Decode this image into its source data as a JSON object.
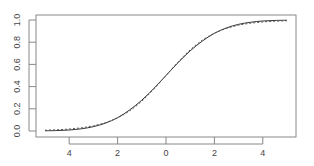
{
  "chart_data": {
    "type": "line",
    "title": "",
    "xlabel": "",
    "ylabel": "",
    "xlim": [
      -5.3,
      5.4
    ],
    "ylim": [
      -0.04,
      1.04
    ],
    "grid": false,
    "legend": null,
    "x_ticks": [
      -4,
      -2,
      0,
      2,
      4
    ],
    "x_tick_labels": [
      "4",
      "2",
      "0",
      "2",
      "4"
    ],
    "y_ticks": [
      0.0,
      0.2,
      0.4,
      0.6,
      0.8,
      1.0
    ],
    "y_tick_labels": [
      "0.0",
      "0.2",
      "0.4",
      "0.6",
      "0.8",
      "1.0"
    ],
    "series": [
      {
        "name": "solid",
        "style": "solid",
        "color": "#333333",
        "x": [
          -5,
          -4.5,
          -4,
          -3.5,
          -3,
          -2.5,
          -2,
          -1.5,
          -1,
          -0.5,
          0,
          0.5,
          1,
          1.5,
          2,
          2.5,
          3,
          3.5,
          4,
          4.5,
          5
        ],
        "values": [
          0.002,
          0.004,
          0.009,
          0.02,
          0.039,
          0.071,
          0.12,
          0.19,
          0.278,
          0.384,
          0.5,
          0.616,
          0.722,
          0.81,
          0.88,
          0.929,
          0.961,
          0.98,
          0.991,
          0.996,
          0.998
        ]
      },
      {
        "name": "dashed",
        "style": "dashed",
        "color": "#555555",
        "x": [
          -5,
          -4.5,
          -4,
          -3.5,
          -3,
          -2.5,
          -2,
          -1.5,
          -1,
          -0.5,
          0,
          0.5,
          1,
          1.5,
          2,
          2.5,
          3,
          3.5,
          4,
          4.5,
          5
        ],
        "values": [
          0.007,
          0.011,
          0.018,
          0.029,
          0.047,
          0.076,
          0.119,
          0.182,
          0.269,
          0.378,
          0.5,
          0.622,
          0.731,
          0.818,
          0.881,
          0.924,
          0.953,
          0.971,
          0.982,
          0.989,
          0.993
        ]
      }
    ]
  }
}
